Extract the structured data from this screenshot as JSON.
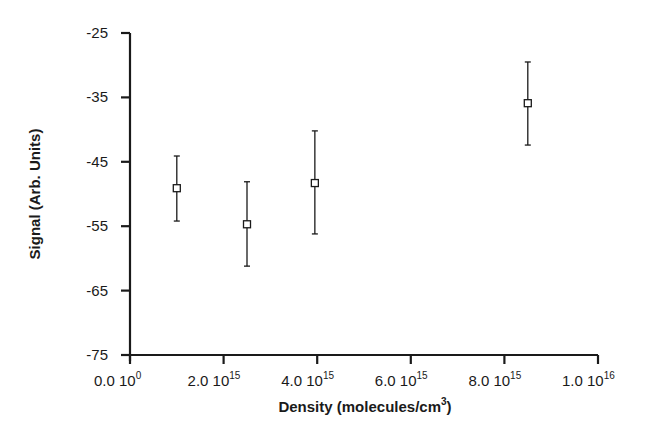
{
  "chart_data": {
    "type": "scatter",
    "title": "",
    "xlabel": "Density (molecules/cm3)",
    "xlabel_main": "Density  (molecules/cm",
    "xlabel_sup": "3",
    "xlabel_close": ")",
    "ylabel": "Signal  (Arb.  Units)",
    "xlim": [
      0,
      1e+16
    ],
    "ylim": [
      -75,
      -25
    ],
    "grid": false,
    "legend": null,
    "y_ticks": [
      -25,
      -35,
      -45,
      -55,
      -65,
      -75
    ],
    "y_tick_labels": [
      "-25",
      "-35",
      "-45",
      "-55",
      "-65",
      "-75"
    ],
    "x_ticks": [
      0,
      2000000000000000.0,
      4000000000000000.0,
      6000000000000000.0,
      8000000000000000.0,
      1e+16
    ],
    "x_tick_labels": [
      {
        "mant": "0.0 10",
        "exp": "0"
      },
      {
        "mant": "2.0 10",
        "exp": "15"
      },
      {
        "mant": "4.0 10",
        "exp": "15"
      },
      {
        "mant": "6.0 10",
        "exp": "15"
      },
      {
        "mant": "8.0 10",
        "exp": "15"
      },
      {
        "mant": "1.0 10",
        "exp": "16"
      }
    ],
    "series": [
      {
        "name": "Signal",
        "marker": "open-square",
        "points": [
          {
            "x": 1000000000000000.0,
            "y": -49.1,
            "err_high": -44.1,
            "err_low": -54.2
          },
          {
            "x": 2500000000000000.0,
            "y": -54.7,
            "err_high": -48.1,
            "err_low": -61.2
          },
          {
            "x": 3950000000000000.0,
            "y": -48.3,
            "err_high": -40.2,
            "err_low": -56.2
          },
          {
            "x": 8500000000000000.0,
            "y": -35.9,
            "err_high": -29.5,
            "err_low": -42.4
          }
        ]
      }
    ]
  },
  "colors": {
    "ink": "#1a1a1a",
    "background": "#ffffff"
  }
}
